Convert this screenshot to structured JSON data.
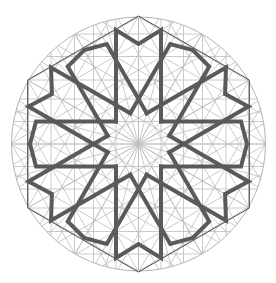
{
  "canvas": {
    "width": 276,
    "height": 283
  },
  "geometry": {
    "center": [
      138.5,
      144
    ],
    "circle_radius": 127,
    "hexagon_radius": 128,
    "hexagon_start_angle_deg": -90,
    "bar_offset": 22.5,
    "bar_inner_y": -22.5,
    "sector_count": 12,
    "vertex_sector_cap": {
      "type": "concave-M",
      "peak_y": -114,
      "notch_y": -100
    },
    "edge_sector_cap": {
      "type": "convex-point",
      "end_y": -102.5,
      "tip_y": -108.5
    },
    "construction_offsets": [
      0,
      22.5,
      45,
      64,
      87.5,
      110
    ],
    "construction_directions_deg": [
      0,
      30,
      60,
      90,
      120,
      150
    ],
    "radial_spokes_deg_step": 15
  },
  "colors": {
    "background": "#ffffff",
    "strapwork": "#5a5a5a",
    "hexagon": "#4d4d4d",
    "construction": "#bdbdbd",
    "circle": "#b5b5b5"
  },
  "stroke_widths": {
    "strapwork": 4,
    "hexagon": 1,
    "construction": 0.8,
    "circle": 1
  }
}
